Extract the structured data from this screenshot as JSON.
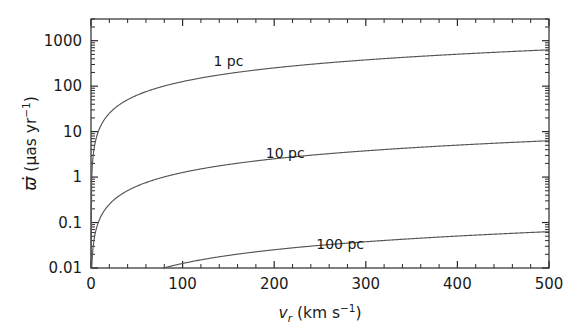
{
  "chart_data": {
    "type": "line",
    "title": "",
    "xlabel": "v_r (km s^-1)",
    "xlabel_parts": {
      "symbol": "v",
      "subscript": "r",
      "units_open": " (km s",
      "units_exp": "−1",
      "units_close": ")"
    },
    "ylabel": "ϖ̇ (μas yr^-1)",
    "ylabel_parts": {
      "symbol": "ϖ",
      "dot": "̇",
      "units_open": "(μas yr",
      "units_exp": "−1",
      "units_close": ")"
    },
    "xscale": "linear",
    "yscale": "log",
    "xlim": [
      0,
      500
    ],
    "ylim": [
      0.01,
      3000
    ],
    "grid": false,
    "legend": "inline-annotations",
    "xticks": [
      0,
      100,
      200,
      300,
      400,
      500
    ],
    "xtick_labels": [
      "0",
      "100",
      "200",
      "300",
      "400",
      "500"
    ],
    "xminor_step": 20,
    "yticks": [
      0.01,
      0.1,
      1,
      10,
      100,
      1000
    ],
    "ytick_labels": [
      "0.01",
      "0.1",
      "1",
      "10",
      "100",
      "1000"
    ],
    "series": [
      {
        "name": "1 pc",
        "distance_pc": 1,
        "label": "1 pc",
        "label_x": 150,
        "label_y": 280,
        "color": "#555555",
        "x": [
          0,
          5,
          10,
          20,
          30,
          50,
          75,
          100,
          150,
          200,
          250,
          300,
          350,
          400,
          450,
          500
        ],
        "y": [
          0.01,
          6.3,
          12.6,
          25.2,
          37.8,
          63,
          94.5,
          126,
          189,
          252,
          315,
          378,
          441,
          504,
          567,
          630
        ]
      },
      {
        "name": "10 pc",
        "distance_pc": 10,
        "label": "10 pc",
        "label_x": 212,
        "label_y": 2.6,
        "color": "#555555",
        "x": [
          0,
          5,
          10,
          20,
          30,
          50,
          75,
          100,
          150,
          200,
          250,
          300,
          350,
          400,
          450,
          500
        ],
        "y": [
          0.0001,
          0.063,
          0.126,
          0.252,
          0.378,
          0.63,
          0.945,
          1.26,
          1.89,
          2.52,
          3.15,
          3.78,
          4.41,
          5.04,
          5.67,
          6.3
        ]
      },
      {
        "name": "100 pc",
        "distance_pc": 100,
        "label": "100 pc",
        "label_x": 272,
        "label_y": 0.026,
        "color": "#555555",
        "x": [
          0,
          5,
          10,
          20,
          30,
          50,
          75,
          100,
          150,
          200,
          250,
          300,
          350,
          400,
          450,
          500
        ],
        "y": [
          1e-06,
          0.00063,
          0.00126,
          0.00252,
          0.00378,
          0.0063,
          0.00945,
          0.0126,
          0.0189,
          0.0252,
          0.0315,
          0.0378,
          0.0441,
          0.0504,
          0.0567,
          0.063
        ]
      }
    ],
    "relation": "proper motion change rate scales linearly with radial velocity and inversely with distance squared",
    "frame": {
      "left": 91,
      "right": 549,
      "top": 19,
      "bottom": 268,
      "color": "#2a2a2a"
    },
    "axis_color": "#2a2a2a",
    "curve_color": "#555555",
    "background": "#ffffff"
  }
}
